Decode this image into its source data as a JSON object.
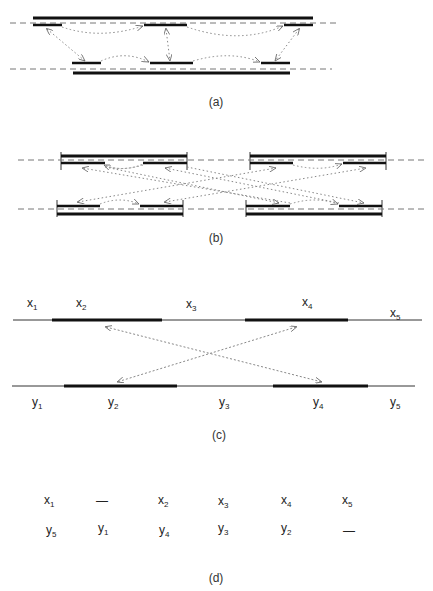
{
  "panels": {
    "a": {
      "caption": "(a)"
    },
    "b": {
      "caption": "(b)"
    },
    "c": {
      "caption": "(c)",
      "top_labels": [
        {
          "base": "x",
          "sub": "1"
        },
        {
          "base": "x",
          "sub": "2"
        },
        {
          "base": "x",
          "sub": "3"
        },
        {
          "base": "x",
          "sub": "4"
        },
        {
          "base": "x",
          "sub": "5"
        }
      ],
      "bottom_labels": [
        {
          "base": "y",
          "sub": "1"
        },
        {
          "base": "y",
          "sub": "2"
        },
        {
          "base": "y",
          "sub": "3"
        },
        {
          "base": "y",
          "sub": "4"
        },
        {
          "base": "y",
          "sub": "5"
        }
      ]
    },
    "d": {
      "caption": "(d)",
      "row1": [
        {
          "base": "x",
          "sub": "1"
        },
        {
          "base": "—",
          "sub": ""
        },
        {
          "base": "x",
          "sub": "2"
        },
        {
          "base": "x",
          "sub": "3"
        },
        {
          "base": "x",
          "sub": "4"
        },
        {
          "base": "x",
          "sub": "5"
        }
      ],
      "row2": [
        {
          "base": "y",
          "sub": "5"
        },
        {
          "base": "y",
          "sub": "1"
        },
        {
          "base": "y",
          "sub": "4"
        },
        {
          "base": "y",
          "sub": "3"
        },
        {
          "base": "y",
          "sub": "2"
        },
        {
          "base": "—",
          "sub": ""
        }
      ]
    }
  },
  "colors": {
    "thick_line": "#111111",
    "thin_line": "#333333",
    "dashed_line": "#777777",
    "dotted_arrow": "#888888"
  }
}
